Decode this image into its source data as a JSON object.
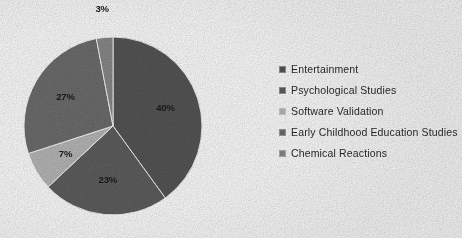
{
  "chart_data": {
    "type": "pie",
    "title": "",
    "categories": [
      "Entertainment",
      "Psychological Studies",
      "Software Validation",
      "Early Childhood Education Studies",
      "Chemical Reactions"
    ],
    "values": [
      40,
      23,
      7,
      27,
      3
    ],
    "value_labels": [
      "40%",
      "23%",
      "7%",
      "27%",
      "3%"
    ],
    "colors": [
      "#575757",
      "#5e5e5e",
      "#b9b9b9",
      "#6e6e6e",
      "#8a8a8a"
    ],
    "legend_position": "right",
    "grid": false,
    "start_angle_deg": 0,
    "direction": "clockwise",
    "label_positions": [
      "inside",
      "inside",
      "inside",
      "inside",
      "outside"
    ]
  },
  "legend": {
    "items": [
      {
        "label": "Entertainment",
        "color": "#575757",
        "marker": "square-marker"
      },
      {
        "label": "Psychological Studies",
        "color": "#5e5e5e",
        "marker": "square-marker"
      },
      {
        "label": "Software Validation",
        "color": "#b9b9b9",
        "marker": "square-marker"
      },
      {
        "label": "Early Childhood Education Studies",
        "color": "#6e6e6e",
        "marker": "square-marker"
      },
      {
        "label": "Chemical Reactions",
        "color": "#8a8a8a",
        "marker": "square-marker"
      }
    ]
  },
  "pie_geometry": {
    "cx": 113,
    "cy": 126,
    "r": 89
  }
}
